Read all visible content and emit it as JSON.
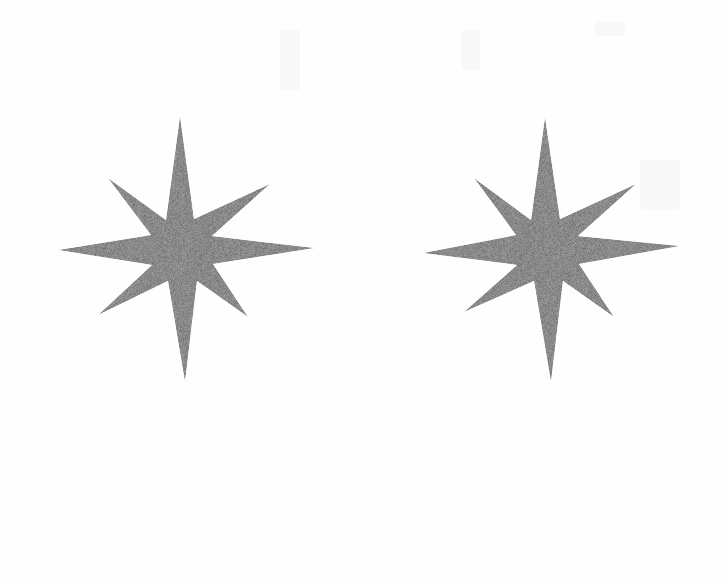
{
  "page": {
    "width": 728,
    "height": 580,
    "background": "#fefefe"
  },
  "style": {
    "star_fill": "#bcbcbc",
    "star_texture_dark": "#a8a8a8",
    "star_texture_light": "#d2d2d2"
  },
  "stars": [
    {
      "id": "left-star",
      "shape": "eight-pointed-star",
      "center": [
        182,
        250
      ],
      "points": [
        [
          180,
          116
        ],
        [
          194,
          219
        ],
        [
          270,
          184
        ],
        [
          212,
          236
        ],
        [
          315,
          248
        ],
        [
          213,
          264
        ],
        [
          248,
          317
        ],
        [
          197,
          281
        ],
        [
          185,
          382
        ],
        [
          168,
          281
        ],
        [
          98,
          315
        ],
        [
          152,
          265
        ],
        [
          58,
          250
        ],
        [
          151,
          235
        ],
        [
          108,
          178
        ],
        [
          166,
          220
        ]
      ]
    },
    {
      "id": "right-star",
      "shape": "eight-pointed-star",
      "center": [
        547,
        250
      ],
      "points": [
        [
          545,
          117
        ],
        [
          560,
          219
        ],
        [
          636,
          184
        ],
        [
          578,
          236
        ],
        [
          680,
          246
        ],
        [
          579,
          264
        ],
        [
          614,
          317
        ],
        [
          563,
          281
        ],
        [
          551,
          382
        ],
        [
          534,
          281
        ],
        [
          464,
          312
        ],
        [
          517,
          265
        ],
        [
          423,
          253
        ],
        [
          516,
          235
        ],
        [
          474,
          178
        ],
        [
          531,
          220
        ]
      ]
    }
  ]
}
